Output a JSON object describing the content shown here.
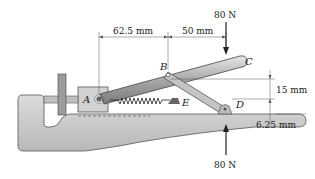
{
  "diagram": {
    "type": "mechanical-toggle-clamp",
    "points": {
      "A": "A",
      "B": "B",
      "C": "C",
      "D": "D",
      "E": "E"
    },
    "dimensions": {
      "ab_horizontal": "62.5 mm",
      "bc_horizontal": "50 mm",
      "vertical_b_to_d": "15 mm",
      "vertical_d_to_handle": "6.25 mm"
    },
    "forces": {
      "top": "80 N",
      "bottom": "80 N"
    },
    "colors": {
      "body": "#c8c8c8",
      "handle": "#9a9a9a",
      "line": "#333333"
    }
  }
}
